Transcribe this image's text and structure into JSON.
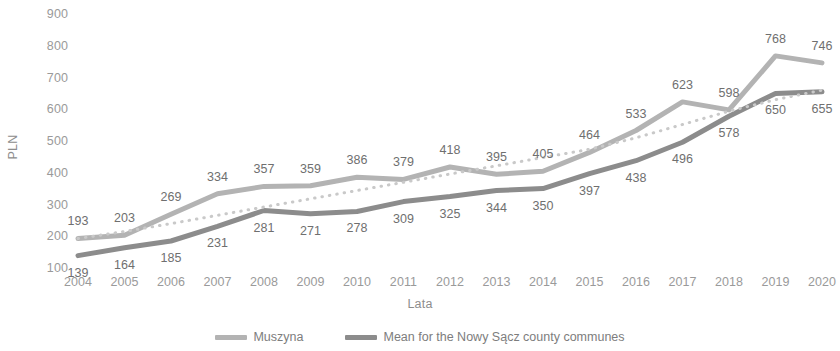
{
  "chart_data": {
    "type": "line",
    "title": "",
    "xlabel": "Lata",
    "ylabel": "PLN",
    "categories": [
      "2004",
      "2005",
      "2006",
      "2007",
      "2008",
      "2009",
      "2010",
      "2011",
      "2012",
      "2013",
      "2014",
      "2015",
      "2016",
      "2017",
      "2018",
      "2019",
      "2020"
    ],
    "ylim": [
      100,
      900
    ],
    "yticks": [
      100,
      200,
      300,
      400,
      500,
      600,
      700,
      800,
      900
    ],
    "grid": false,
    "legend_position": "bottom",
    "series": [
      {
        "name": "Muszyna",
        "color": "#b3b3b3",
        "style": "solid",
        "values": [
          193,
          203,
          269,
          334,
          357,
          359,
          386,
          379,
          418,
          395,
          405,
          464,
          533,
          623,
          598,
          768,
          746
        ],
        "label_offset": "above"
      },
      {
        "name": "Mean for the Nowy Sącz county communes",
        "color": "#8c8c8c",
        "style": "solid",
        "values": [
          139,
          164,
          185,
          231,
          281,
          271,
          278,
          309,
          325,
          344,
          350,
          397,
          438,
          496,
          578,
          650,
          655
        ],
        "label_offset": "below"
      },
      {
        "name": "trendline",
        "color": "#c9c9c9",
        "style": "dotted",
        "values": [
          193,
          215,
          240,
          266,
          292,
          318,
          344,
          370,
          396,
          422,
          448,
          474,
          510,
          552,
          594,
          630,
          660
        ],
        "label_offset": "none",
        "hidden_from_legend": true
      }
    ],
    "legend": [
      {
        "label": "Muszyna",
        "color": "#b3b3b3"
      },
      {
        "label": "Mean for the Nowy Sącz county communes",
        "color": "#8c8c8c"
      }
    ]
  },
  "axis": {
    "y_label": "PLN",
    "x_label": "Lata",
    "y_ticks": [
      "900",
      "800",
      "700",
      "600",
      "500",
      "400",
      "300",
      "200",
      "100"
    ],
    "x_ticks": [
      "2004",
      "2005",
      "2006",
      "2007",
      "2008",
      "2009",
      "2010",
      "2011",
      "2012",
      "2013",
      "2014",
      "2015",
      "2016",
      "2017",
      "2018",
      "2019",
      "2020"
    ]
  },
  "colors": {
    "muszyna": "#b3b3b3",
    "mean": "#8c8c8c",
    "trend": "#c9c9c9",
    "text": "#8d8d8d",
    "label_text": "#6f6f6f",
    "background": "#ffffff"
  }
}
